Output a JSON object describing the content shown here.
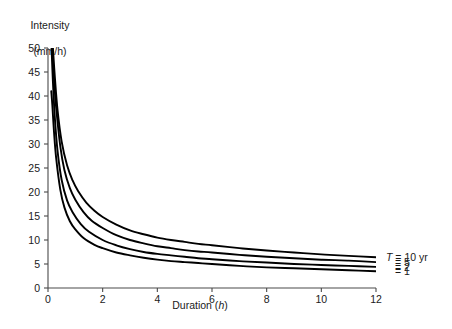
{
  "chart_data": {
    "type": "line",
    "title": "",
    "xlabel": "Duration (h)",
    "ylabel": "Intensity (mm/h)",
    "ylabel_line1": "Intensity",
    "ylabel_line2": "(mm/h)",
    "xlim": [
      0,
      12
    ],
    "ylim": [
      0,
      50
    ],
    "xticks": [
      0,
      2,
      4,
      6,
      8,
      10,
      12
    ],
    "xticklabels": [
      "0",
      "2",
      "4",
      "6",
      "8",
      "10",
      "12"
    ],
    "yticks": [
      0,
      5,
      10,
      15,
      20,
      25,
      30,
      35,
      40,
      45,
      50
    ],
    "yticklabels": [
      "0",
      "5",
      "10",
      "15",
      "20",
      "25",
      "30",
      "35",
      "40",
      "45",
      "50"
    ],
    "grid": false,
    "legend_position": "right-outside",
    "legend_labels": [
      "T = 10 yr",
      "= 5",
      "= 2",
      "= 1"
    ],
    "series": [
      {
        "name": "T = 10 yr",
        "label": "T = 10 yr",
        "color": "#000000",
        "x": [
          0.18,
          0.25,
          0.35,
          0.5,
          0.7,
          0.9,
          1.1,
          1.4,
          1.7,
          2.0,
          2.5,
          3.0,
          3.5,
          4.0,
          4.5,
          5.0,
          5.5,
          6.0,
          7.0,
          8.0,
          9.0,
          10.0,
          11.0,
          12.0
        ],
        "y": [
          50.0,
          44.0,
          37.0,
          30.5,
          25.5,
          22.4,
          20.2,
          17.8,
          16.1,
          14.8,
          13.2,
          12.0,
          11.2,
          10.5,
          10.0,
          9.6,
          9.2,
          8.9,
          8.3,
          7.8,
          7.4,
          7.0,
          6.7,
          6.4
        ]
      },
      {
        "name": "T = 5 yr",
        "label": "= 5",
        "color": "#000000",
        "x": [
          0.15,
          0.22,
          0.3,
          0.45,
          0.6,
          0.8,
          1.0,
          1.3,
          1.6,
          2.0,
          2.5,
          3.0,
          3.5,
          4.0,
          4.5,
          5.0,
          5.5,
          6.0,
          7.0,
          8.0,
          9.0,
          10.0,
          11.0,
          12.0
        ],
        "y": [
          50.0,
          43.5,
          37.5,
          29.5,
          24.6,
          20.8,
          18.4,
          15.8,
          14.0,
          12.5,
          11.0,
          10.0,
          9.3,
          8.7,
          8.3,
          7.9,
          7.6,
          7.4,
          6.9,
          6.5,
          6.2,
          5.9,
          5.7,
          5.4
        ]
      },
      {
        "name": "T = 2 yr",
        "label": "= 2",
        "color": "#000000",
        "x": [
          0.13,
          0.18,
          0.25,
          0.35,
          0.5,
          0.7,
          0.9,
          1.2,
          1.5,
          2.0,
          2.5,
          3.0,
          3.5,
          4.0,
          4.5,
          5.0,
          5.5,
          6.0,
          7.0,
          8.0,
          9.0,
          10.0,
          11.0,
          12.0
        ],
        "y": [
          50.0,
          43.0,
          35.5,
          28.5,
          22.5,
          18.2,
          15.8,
          13.3,
          11.7,
          10.0,
          8.9,
          8.1,
          7.5,
          7.1,
          6.8,
          6.5,
          6.2,
          6.0,
          5.6,
          5.3,
          5.0,
          4.8,
          4.6,
          4.4
        ]
      },
      {
        "name": "T = 1 yr",
        "label": "= 1",
        "color": "#000000",
        "x": [
          0.12,
          0.16,
          0.22,
          0.3,
          0.45,
          0.6,
          0.8,
          1.0,
          1.3,
          1.7,
          2.0,
          2.5,
          3.0,
          3.5,
          4.0,
          4.5,
          5.0,
          5.5,
          6.0,
          7.0,
          8.0,
          9.0,
          10.0,
          11.0,
          12.0
        ],
        "y": [
          41.0,
          38.0,
          32.5,
          27.0,
          20.5,
          16.8,
          13.9,
          12.2,
          10.4,
          9.0,
          8.3,
          7.4,
          6.8,
          6.3,
          5.9,
          5.6,
          5.4,
          5.2,
          5.0,
          4.6,
          4.3,
          4.1,
          3.9,
          3.7,
          3.5
        ]
      }
    ]
  },
  "axis": {
    "line_color": "#4a4a4a",
    "curve_color": "#000000"
  }
}
